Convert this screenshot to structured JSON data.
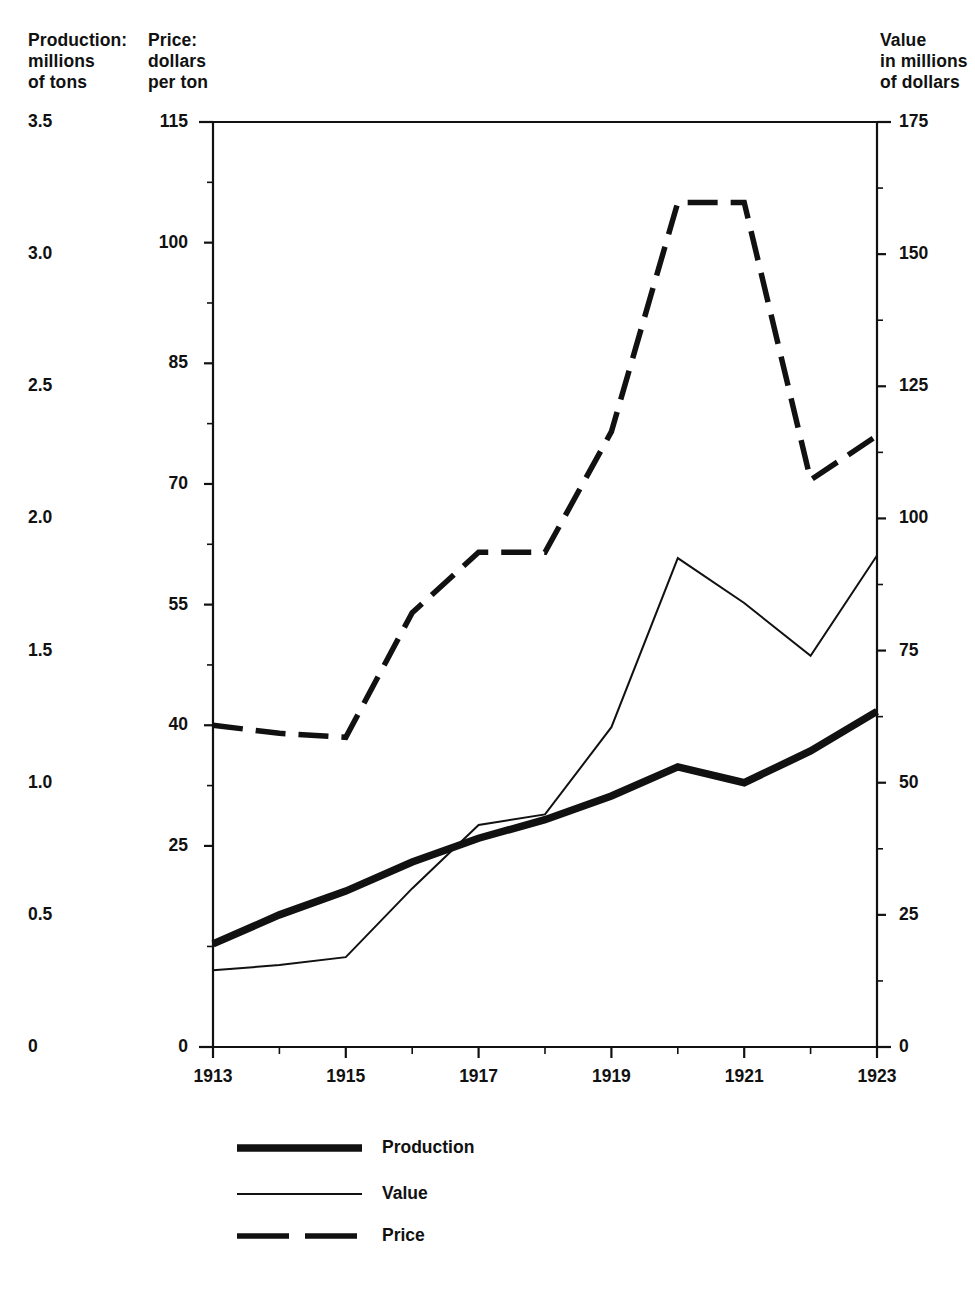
{
  "chart_data": {
    "type": "line",
    "title": "",
    "subtitle": "",
    "xlabel": "",
    "x": [
      1913,
      1914,
      1915,
      1916,
      1917,
      1918,
      1919,
      1920,
      1921,
      1922,
      1923
    ],
    "xlim": [
      1913,
      1923
    ],
    "x_tick_labels": [
      "1913",
      "1915",
      "1917",
      "1919",
      "1921",
      "1923"
    ],
    "x_tick_values": [
      1913,
      1915,
      1917,
      1919,
      1921,
      1923
    ],
    "x_minor_tick_values": [
      1914,
      1916,
      1918,
      1920,
      1922
    ],
    "grid": false,
    "legend_position": "bottom-left",
    "axes": [
      {
        "id": "production",
        "side": "left",
        "caption": "Production:\nmillions\nof tons",
        "label": "Production: millions of tons",
        "ylim": [
          0,
          3.5
        ],
        "tick_labels": [
          "3.5",
          "3.0",
          "2.5",
          "2.0",
          "1.5",
          "1.0",
          "0.5",
          "0"
        ],
        "tick_values": [
          3.5,
          3.0,
          2.5,
          2.0,
          1.5,
          1.0,
          0.5,
          0
        ]
      },
      {
        "id": "price",
        "side": "left-inner",
        "caption": "Price:\ndollars\nper ton",
        "label": "Price: dollars per ton",
        "ylim": [
          0,
          115
        ],
        "tick_labels": [
          "115",
          "100",
          "85",
          "70",
          "55",
          "40",
          "25",
          "0"
        ],
        "tick_values": [
          115,
          100,
          85,
          70,
          55,
          40,
          25,
          0
        ]
      },
      {
        "id": "value",
        "side": "right",
        "caption": "Value\nin millions\nof dollars",
        "label": "Value in millions of dollars",
        "ylim": [
          0,
          175
        ],
        "tick_labels": [
          "175",
          "150",
          "125",
          "100",
          "75",
          "50",
          "25",
          "0"
        ],
        "tick_values": [
          175,
          150,
          125,
          100,
          75,
          50,
          25,
          0
        ]
      }
    ],
    "series": [
      {
        "name": "Production",
        "axis": "production",
        "units": "millions of tons",
        "style": "thick-solid",
        "color": "#111111",
        "values": [
          0.39,
          0.5,
          0.59,
          0.7,
          0.79,
          0.86,
          0.95,
          1.06,
          1.0,
          1.12,
          1.27
        ]
      },
      {
        "name": "Value",
        "axis": "value",
        "units": "millions of dollars",
        "color": "#111111",
        "style": "thin-solid",
        "values": [
          14.5,
          15.5,
          17.0,
          30.0,
          42.0,
          44.0,
          60.5,
          92.5,
          84.0,
          74.0,
          93.0
        ]
      },
      {
        "name": "Price",
        "axis": "price",
        "units": "dollars per ton",
        "color": "#111111",
        "style": "dashed",
        "values": [
          40.0,
          39.0,
          38.5,
          54.0,
          61.5,
          61.5,
          76.5,
          105.0,
          105.0,
          70.5,
          76.0
        ]
      }
    ],
    "legend": [
      {
        "label": "Production",
        "style": "thick-solid"
      },
      {
        "label": "Value",
        "style": "thin-solid"
      },
      {
        "label": "Price",
        "style": "dashed"
      }
    ]
  }
}
